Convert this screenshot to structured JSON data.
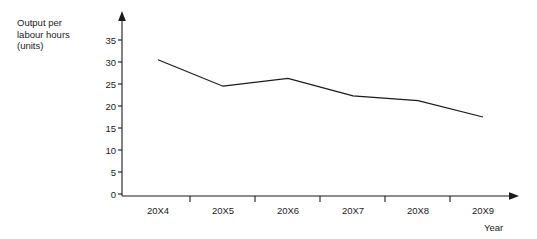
{
  "chart_data": {
    "type": "line",
    "title": "",
    "categories": [
      "20X4",
      "20X5",
      "20X6",
      "20X7",
      "20X8",
      "20X9"
    ],
    "values": [
      30.5,
      24.5,
      26.3,
      22.3,
      21.2,
      17.5
    ],
    "series": [
      {
        "name": "Output per labour hours (units)",
        "values": [
          30.5,
          24.5,
          26.3,
          22.3,
          21.2,
          17.5
        ]
      }
    ],
    "xlabel": "Year",
    "ylabel": "Output per labour hours (units)",
    "ylim": [
      0,
      35
    ],
    "ytick_step": 5,
    "yticks": [
      "35",
      "30",
      "25",
      "20",
      "15",
      "10",
      "5",
      "0"
    ],
    "grid": false,
    "legend": "none",
    "line_color": "#1a1a1a",
    "axis_color": "#1a1a1a"
  }
}
